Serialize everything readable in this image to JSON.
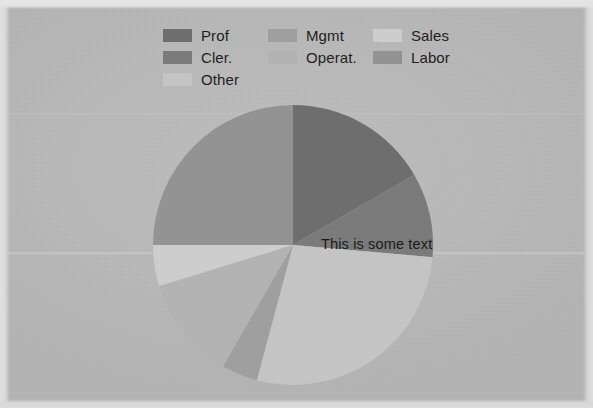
{
  "figure": {
    "background_color": "#b9b9b9",
    "annotation": "This is some text"
  },
  "legend": {
    "position": "top",
    "columns": 3,
    "items": [
      {
        "label": "Prof",
        "color": "#6e6e6e"
      },
      {
        "label": "Mgmt",
        "color": "#a0a0a0"
      },
      {
        "label": "Sales",
        "color": "#cfcfcf"
      },
      {
        "label": "Cler.",
        "color": "#7b7b7b"
      },
      {
        "label": "Operat.",
        "color": "#b4b4b4"
      },
      {
        "label": "Labor",
        "color": "#949494"
      },
      {
        "label": "Other",
        "color": "#c6c6c6"
      }
    ]
  },
  "chart_data": {
    "type": "pie",
    "title": "",
    "labels": [
      "Prof",
      "Cler.",
      "Other",
      "Mgmt",
      "Operat.",
      "Sales",
      "Labor"
    ],
    "values": [
      16.7,
      9.7,
      27.8,
      4.2,
      12.0,
      15.0,
      14.6
    ],
    "colors": [
      "#6e6e6e",
      "#7b7b7b",
      "#c6c6c6",
      "#a0a0a0",
      "#b4b4b4",
      "#cfcfcf",
      "#949494"
    ],
    "start_angle": 90,
    "direction": "clockwise",
    "annotations": [
      {
        "text": "This is some text",
        "x": 321,
        "y": 243
      }
    ],
    "center": {
      "x": 293,
      "y": 245
    },
    "radius": 140,
    "slice_angles_deg": [
      60,
      35,
      100,
      15,
      43,
      17,
      90
    ]
  }
}
